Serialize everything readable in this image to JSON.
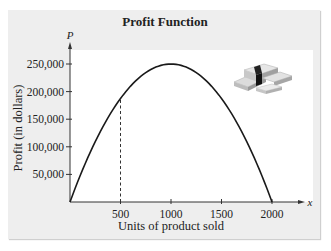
{
  "chart_data": {
    "type": "line",
    "title": "Profit Function",
    "xlabel": "Units of product sold",
    "ylabel": "Profit (in dollars)",
    "x_axis_var": "x",
    "y_axis_var": "P",
    "xlim": [
      0,
      2000
    ],
    "ylim": [
      0,
      250000
    ],
    "x_ticks": [
      500,
      1000,
      1500,
      2000
    ],
    "x_tick_labels": [
      "500",
      "1000",
      "1500",
      "2000"
    ],
    "y_ticks": [
      50000,
      100000,
      150000,
      200000,
      250000
    ],
    "y_tick_labels": [
      "50,000",
      "100,000",
      "150,000",
      "200,000",
      "250,000"
    ],
    "grid": false,
    "series": [
      {
        "name": "Profit",
        "function": "P = -0.25x^2 + 500x",
        "x": [
          0,
          250,
          500,
          750,
          1000,
          1250,
          1500,
          1750,
          2000
        ],
        "y": [
          0,
          109375,
          187500,
          234375,
          250000,
          234375,
          187500,
          109375,
          0
        ]
      }
    ],
    "annotations": [
      {
        "type": "dashed-vertical-line",
        "x": 500,
        "y_to": 187500
      },
      {
        "type": "image",
        "description": "stacks of money"
      }
    ]
  }
}
